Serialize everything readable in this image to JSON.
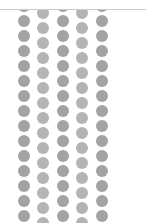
{
  "page": {
    "width": 146,
    "height": 223,
    "background_color": "#ffffff"
  },
  "top_rule": {
    "name": "horizontal-divider",
    "color": "#c9c9c9",
    "y": 9,
    "thickness": 1,
    "width": 146
  },
  "pattern": {
    "name": "polka-dot-pattern",
    "dot_color": "#a3a3a3",
    "dot_color_alt": "#b4b4b4",
    "dot_diameter": 12,
    "column_pitch": 19.5,
    "row_pitch": 15,
    "band_left": 16,
    "band_top": 10,
    "band_width": 97,
    "band_height": 213,
    "columns": [
      {
        "index": 0,
        "x": 2,
        "y_offset": 5,
        "shade": "solid"
      },
      {
        "index": 1,
        "x": 21,
        "y_offset": -3,
        "shade": "faint"
      },
      {
        "index": 2,
        "x": 41,
        "y_offset": 5,
        "shade": "solid"
      },
      {
        "index": 3,
        "x": 60,
        "y_offset": -3,
        "shade": "faint"
      },
      {
        "index": 4,
        "x": 80,
        "y_offset": 5,
        "shade": "solid"
      }
    ],
    "rows_per_column": 16
  }
}
